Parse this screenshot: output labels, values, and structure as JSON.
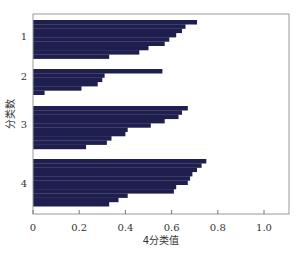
{
  "chart_data": {
    "type": "bar",
    "orientation": "horizontal",
    "title": "",
    "xlabel": "4分类值",
    "ylabel": "分类数",
    "xlim": [
      0,
      1.1
    ],
    "xticks": [
      0,
      0.2,
      0.4,
      0.6,
      0.8,
      1.0
    ],
    "xtick_labels": [
      "0",
      "0.2",
      "0.4",
      "0.6",
      "0.8",
      "1.0"
    ],
    "grid": false,
    "legend": null,
    "bar_color": "#1f1f4f",
    "groups": [
      {
        "label": "1",
        "values": [
          0.71,
          0.66,
          0.645,
          0.62,
          0.59,
          0.57,
          0.5,
          0.46,
          0.33
        ]
      },
      {
        "label": "2",
        "values": [
          0.56,
          0.31,
          0.3,
          0.28,
          0.21,
          0.05
        ]
      },
      {
        "label": "3",
        "values": [
          0.67,
          0.645,
          0.63,
          0.57,
          0.51,
          0.41,
          0.4,
          0.34,
          0.32,
          0.23
        ]
      },
      {
        "label": "4",
        "values": [
          0.75,
          0.73,
          0.71,
          0.69,
          0.68,
          0.67,
          0.62,
          0.61,
          0.41,
          0.37,
          0.33
        ]
      }
    ]
  }
}
